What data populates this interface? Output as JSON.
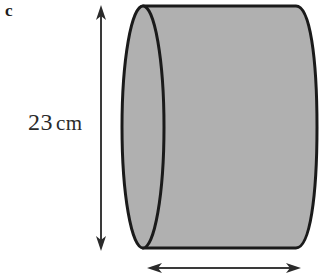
{
  "figure": {
    "part_label": "c",
    "shape": "cylinder",
    "fill_color": "#b0b0b0",
    "outline_color": "#1a1a1a",
    "background_color": "#ffffff"
  },
  "dimensions": {
    "height": {
      "value": "23",
      "unit": "cm",
      "full_label": "23 cm",
      "orientation": "vertical",
      "arrow": "double-headed"
    },
    "width": {
      "full_label": "",
      "orientation": "horizontal",
      "arrow": "double-headed"
    }
  }
}
